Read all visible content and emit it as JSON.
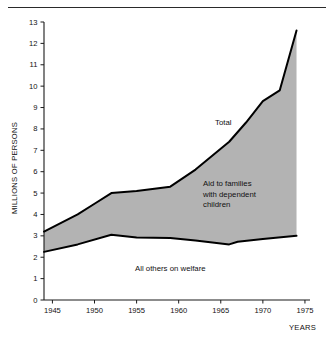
{
  "chart_data": {
    "type": "area",
    "title": "",
    "subtitle": "",
    "xlabel": "YEARS",
    "ylabel": "MILLIONS OF PERSONS",
    "xlim": [
      1944,
      1975.6
    ],
    "ylim": [
      0,
      13
    ],
    "grid": false,
    "legend_position": "inline-annotations",
    "x_ticks": [
      1945,
      1950,
      1955,
      1960,
      1965,
      1970,
      1975
    ],
    "x_tick_labels": [
      "1945",
      "1950",
      "1955",
      "1960",
      "1965",
      "1970",
      "1975"
    ],
    "y_ticks": [
      0,
      1,
      2,
      3,
      4,
      5,
      6,
      7,
      8,
      9,
      10,
      11,
      12,
      13
    ],
    "y_tick_labels": [
      "0",
      "1",
      "2",
      "3",
      "4",
      "5",
      "6",
      "7",
      "8",
      "9",
      "10",
      "11",
      "12",
      "13"
    ],
    "series": [
      {
        "name": "Total",
        "role": "upper-boundary",
        "x": [
          1944,
          1948,
          1950,
          1952,
          1955,
          1959,
          1962,
          1966,
          1968,
          1970,
          1972,
          1974
        ],
        "values": [
          3.2,
          4.0,
          4.5,
          5.0,
          5.1,
          5.3,
          6.1,
          7.4,
          8.3,
          9.3,
          9.8,
          12.6
        ]
      },
      {
        "name": "All others on welfare",
        "role": "lower-boundary",
        "x": [
          1944,
          1948,
          1952,
          1955,
          1959,
          1962,
          1966,
          1967,
          1970,
          1974
        ],
        "values": [
          2.25,
          2.6,
          3.05,
          2.92,
          2.9,
          2.78,
          2.6,
          2.72,
          2.85,
          3.0
        ]
      }
    ],
    "shaded_band": {
      "name": "Aid to families with dependent children",
      "between": [
        "All others on welfare",
        "Total"
      ],
      "fill_color": "#b3b3b3"
    },
    "annotations": [
      {
        "id": "total",
        "text": "Total",
        "x_px": 215,
        "y_px": 125,
        "align": "start",
        "lines": [
          "Total"
        ]
      },
      {
        "id": "afdc",
        "text": "Aid to families with dependent children",
        "x_px": 203,
        "y_px": 186,
        "align": "start",
        "lines": [
          "Aid to families",
          "with dependent",
          "children"
        ]
      },
      {
        "id": "others",
        "text": "All others on welfare",
        "x_px": 135,
        "y_px": 271,
        "align": "start",
        "lines": [
          "All others on welfare"
        ]
      }
    ],
    "colors": {
      "band_fill": "#b3b3b3",
      "line": "#000000",
      "axis": "#1a1a1a",
      "text": "#111111",
      "background": "#ffffff"
    }
  }
}
